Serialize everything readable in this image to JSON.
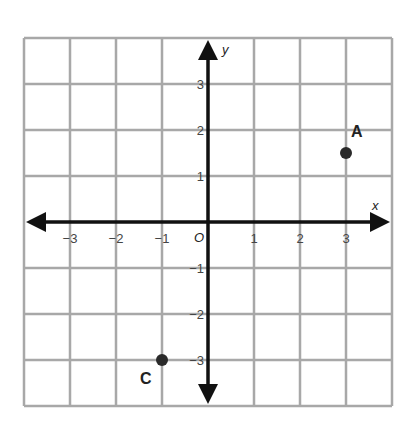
{
  "chart_data": {
    "type": "scatter",
    "title": "",
    "xlabel": "x",
    "ylabel": "y",
    "origin_label": "O",
    "xlim": [
      -4,
      4
    ],
    "ylim": [
      -4,
      4
    ],
    "grid": true,
    "x_ticks": [
      -3,
      -2,
      -1,
      1,
      2,
      3
    ],
    "y_ticks": [
      3,
      2,
      1,
      -1,
      -2,
      -3
    ],
    "x_tick_labels": [
      "−3",
      "−2",
      "−1",
      "1",
      "2",
      "3"
    ],
    "y_tick_labels": [
      "3",
      "2",
      "1",
      "−1",
      "−2",
      "−3"
    ],
    "points": [
      {
        "label": "A",
        "x": 3,
        "y": 1.5
      },
      {
        "label": "C",
        "x": -1,
        "y": -3
      }
    ],
    "colors": {
      "grid": "#a8a8a8",
      "axis": "#111111",
      "point": "#2a2a2a"
    }
  }
}
